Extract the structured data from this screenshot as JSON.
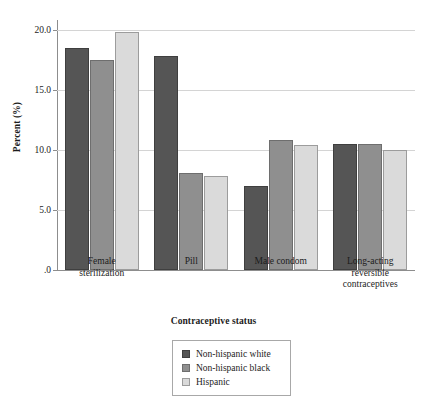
{
  "chart_data": {
    "type": "bar",
    "title": "",
    "xlabel": "Contraceptive status",
    "ylabel": "Percent (%)",
    "categories": [
      "Female sterilization",
      "Pill",
      "Male condom",
      "Long-acting reversible contraceptives"
    ],
    "category_lines": [
      [
        "Female",
        "sterilization"
      ],
      [
        "Pill"
      ],
      [
        "Male condom"
      ],
      [
        "Long-acting",
        "reversible",
        "contraceptives"
      ]
    ],
    "series": [
      {
        "name": "Non-hispanic white",
        "color": "#555555",
        "values": [
          18.5,
          17.8,
          7.0,
          10.5
        ]
      },
      {
        "name": "Non-hispanic black",
        "color": "#8f8f8f",
        "values": [
          17.5,
          8.1,
          10.8,
          10.5
        ]
      },
      {
        "name": "Hispanic",
        "color": "#dadada",
        "values": [
          19.8,
          7.8,
          10.4,
          10.0
        ]
      }
    ],
    "ylim": [
      0,
      20.8
    ],
    "yticks": [
      0,
      5,
      10,
      15,
      20
    ],
    "ytick_labels": [
      ".0",
      "5.0",
      "10.0",
      "15.0",
      "20.0"
    ],
    "grid": true,
    "legend_position": "bottom-center"
  },
  "caption": {
    "text": ""
  }
}
